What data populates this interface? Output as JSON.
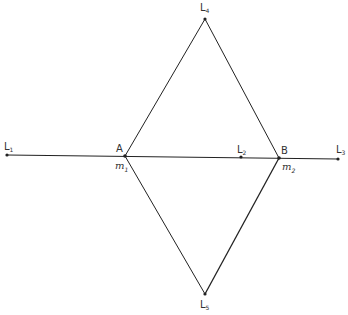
{
  "diagram": {
    "points": {
      "L1": {
        "label": "L",
        "sub": "1",
        "x": 7,
        "y": 155
      },
      "L2": {
        "label": "L",
        "sub": "2",
        "x": 241,
        "y": 157
      },
      "L3": {
        "label": "L",
        "sub": "3",
        "x": 338,
        "y": 159
      },
      "L4": {
        "label": "L",
        "sub": "4",
        "x": 205,
        "y": 19
      },
      "L5": {
        "label": "L",
        "sub": "5",
        "x": 205,
        "y": 294
      },
      "A": {
        "label": "A",
        "x": 125,
        "y": 156
      },
      "B": {
        "label": "B",
        "x": 279,
        "y": 158
      }
    },
    "mass_labels": {
      "m1": {
        "label": "m",
        "sub": "1"
      },
      "m2": {
        "label": "m",
        "sub": "2"
      }
    },
    "colors": {
      "line": "#222222",
      "text": "#333333"
    }
  }
}
